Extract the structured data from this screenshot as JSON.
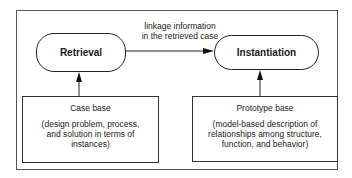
{
  "diagram": {
    "nodes": {
      "retrieval": {
        "label": "Retrieval"
      },
      "instantiation": {
        "label": "Instantiation"
      },
      "case_base": {
        "title": "Case base",
        "description": "(design problem, process, and solution in terms of instances)"
      },
      "prototype_base": {
        "title": "Prototype base",
        "description": "(model-based description of relationships among structure, function, and behavior)"
      }
    },
    "edges": {
      "retrieval_to_instantiation": {
        "label_line1": "linkage information",
        "label_line2": "in the retrieved case"
      }
    }
  }
}
